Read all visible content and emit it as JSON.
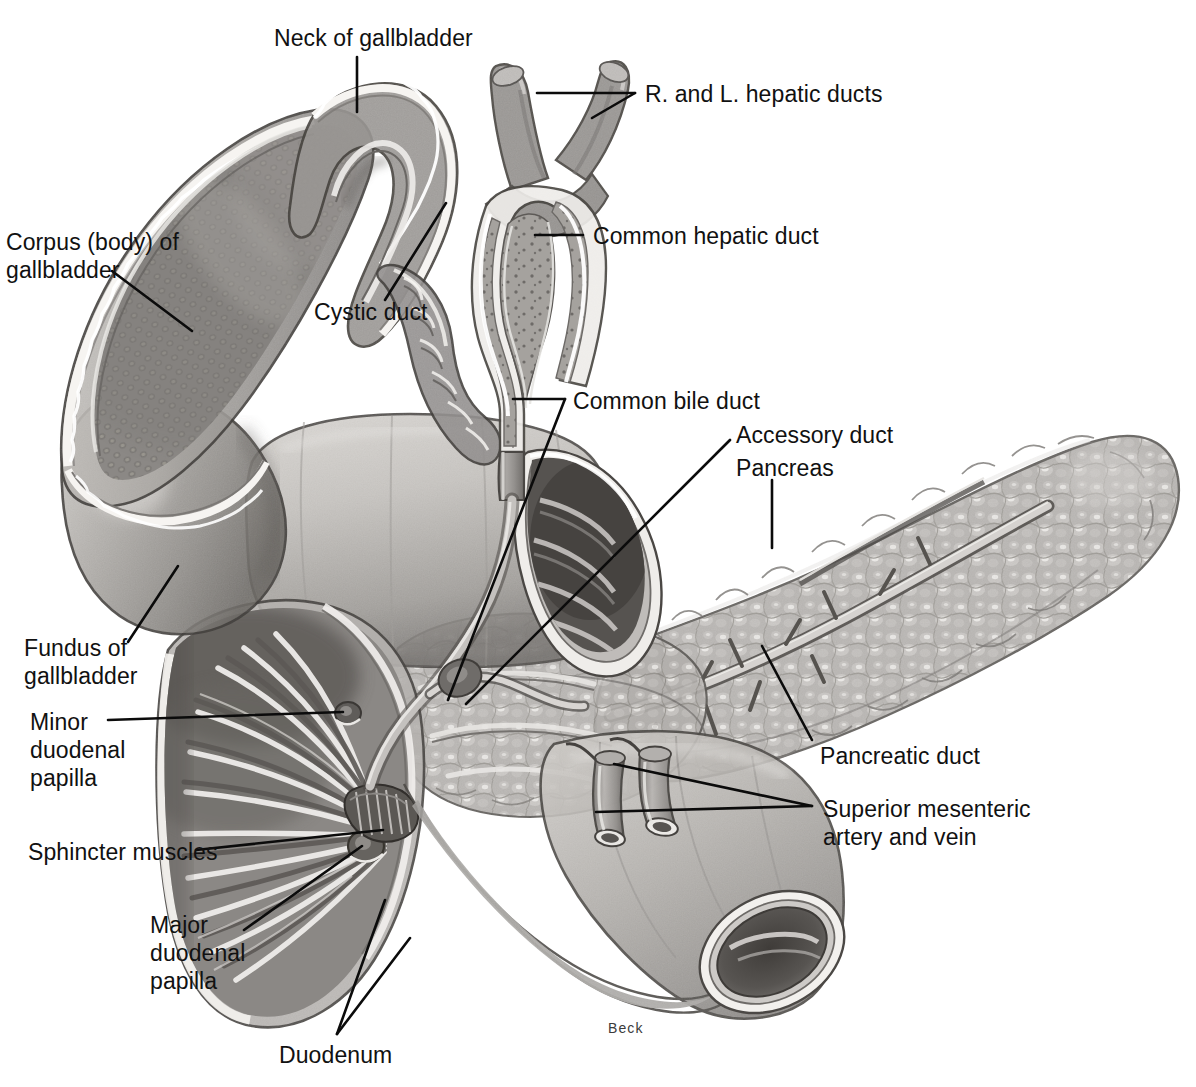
{
  "figure": {
    "signature": "Beck",
    "background_color": "#ffffff",
    "ink_color": "#111111",
    "style": "halftone grayscale anatomical illustration"
  },
  "labels": {
    "neck_of_gallbladder": "Neck of gallbladder",
    "hepatic_ducts": "R. and L. hepatic ducts",
    "common_hepatic_duct": "Common hepatic duct",
    "corpus_line1": "Corpus (body) of",
    "corpus_line2": "gallbladder",
    "cystic_duct": "Cystic duct",
    "common_bile_duct": "Common bile duct",
    "accessory_duct": "Accessory duct",
    "pancreas": "Pancreas",
    "pancreatic_duct": "Pancreatic duct",
    "superior_mesenteric_line1": "Superior mesenteric",
    "superior_mesenteric_line2": "artery and vein",
    "fundus_line1": "Fundus of",
    "fundus_line2": "gallbladder",
    "minor_papilla_line1": "Minor",
    "minor_papilla_line2": "duodenal",
    "minor_papilla_line3": "papilla",
    "sphincter_muscles": "Sphincter muscles",
    "major_papilla_line1": "Major",
    "major_papilla_line2": "duodenal",
    "major_papilla_line3": "papilla",
    "duodenum": "Duodenum"
  },
  "structures": [
    {
      "name": "gallbladder-body",
      "tone": "#8f8c89"
    },
    {
      "name": "gallbladder-fundus",
      "tone": "#a8a5a2"
    },
    {
      "name": "cystic-duct",
      "tone": "#93908d"
    },
    {
      "name": "right-hepatic-duct",
      "tone": "#9b9794"
    },
    {
      "name": "left-hepatic-duct",
      "tone": "#9b9794"
    },
    {
      "name": "common-hepatic-duct",
      "tone": "#9d9996"
    },
    {
      "name": "common-bile-duct",
      "tone": "#9d9996"
    },
    {
      "name": "duodenum-superior",
      "tone": "#b2afac"
    },
    {
      "name": "duodenum-descending",
      "tone": "#8c8986"
    },
    {
      "name": "duodenum-inferior",
      "tone": "#aeaba8"
    },
    {
      "name": "pancreas-head",
      "tone": "#b5b2af"
    },
    {
      "name": "pancreas-body-tail",
      "tone": "#b8b5b2"
    },
    {
      "name": "pancreatic-duct",
      "tone": "#cfccc9"
    },
    {
      "name": "accessory-duct",
      "tone": "#c7c4c1"
    },
    {
      "name": "superior-mesenteric-artery",
      "tone": "#a5a29f"
    },
    {
      "name": "superior-mesenteric-vein",
      "tone": "#a5a29f"
    },
    {
      "name": "major-duodenal-papilla",
      "tone": "#6f6c69"
    },
    {
      "name": "minor-duodenal-papilla",
      "tone": "#6f6c69"
    },
    {
      "name": "sphincter-muscles",
      "tone": "#5e5b58"
    }
  ]
}
